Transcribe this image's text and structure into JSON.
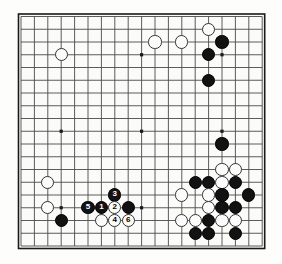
{
  "board": {
    "title": "Go board diagram",
    "size": 19,
    "origin_x": 21,
    "origin_y": 16.5,
    "spacing_x": 13.4,
    "spacing_y": 12.75,
    "stone_radius": 6.6,
    "line_color": "#4a4a4a",
    "border_color": "#1a1a1a",
    "background_color": "#fbfbf9",
    "black_color": "#121212",
    "white_color": "#fcfcfc",
    "star_points": [
      {
        "col": 3,
        "row": 3
      },
      {
        "col": 9,
        "row": 3
      },
      {
        "col": 15,
        "row": 3
      },
      {
        "col": 3,
        "row": 9
      },
      {
        "col": 9,
        "row": 9
      },
      {
        "col": 15,
        "row": 9
      },
      {
        "col": 3,
        "row": 15
      },
      {
        "col": 9,
        "row": 15
      },
      {
        "col": 15,
        "row": 15
      }
    ],
    "stones": [
      {
        "col": 14,
        "row": 1,
        "color": "white",
        "label": ""
      },
      {
        "col": 10,
        "row": 2,
        "color": "white",
        "label": ""
      },
      {
        "col": 12,
        "row": 2,
        "color": "white",
        "label": ""
      },
      {
        "col": 15,
        "row": 2,
        "color": "black",
        "label": ""
      },
      {
        "col": 14,
        "row": 3,
        "color": "black",
        "label": ""
      },
      {
        "col": 3,
        "row": 3,
        "color": "white",
        "label": ""
      },
      {
        "col": 14,
        "row": 5,
        "color": "black",
        "label": ""
      },
      {
        "col": 15,
        "row": 10,
        "color": "black",
        "label": ""
      },
      {
        "col": 15,
        "row": 12,
        "color": "white",
        "label": ""
      },
      {
        "col": 16,
        "row": 12,
        "color": "white",
        "label": ""
      },
      {
        "col": 13,
        "row": 13,
        "color": "black",
        "label": ""
      },
      {
        "col": 14,
        "row": 13,
        "color": "black",
        "label": ""
      },
      {
        "col": 15,
        "row": 13,
        "color": "white",
        "label": ""
      },
      {
        "col": 16,
        "row": 13,
        "color": "black",
        "label": ""
      },
      {
        "col": 2,
        "row": 13,
        "color": "white",
        "label": ""
      },
      {
        "col": 12,
        "row": 14,
        "color": "white",
        "label": ""
      },
      {
        "col": 14,
        "row": 14,
        "color": "white",
        "label": ""
      },
      {
        "col": 15,
        "row": 14,
        "color": "black",
        "label": ""
      },
      {
        "col": 17,
        "row": 14,
        "color": "black",
        "label": ""
      },
      {
        "col": 14,
        "row": 15,
        "color": "white",
        "label": ""
      },
      {
        "col": 15,
        "row": 15,
        "color": "black",
        "label": ""
      },
      {
        "col": 16,
        "row": 15,
        "color": "black",
        "label": ""
      },
      {
        "col": 2,
        "row": 15,
        "color": "white",
        "label": ""
      },
      {
        "col": 12,
        "row": 16,
        "color": "white",
        "label": ""
      },
      {
        "col": 13,
        "row": 16,
        "color": "white",
        "label": ""
      },
      {
        "col": 14,
        "row": 16,
        "color": "black",
        "label": ""
      },
      {
        "col": 15,
        "row": 16,
        "color": "white",
        "label": ""
      },
      {
        "col": 16,
        "row": 16,
        "color": "white",
        "label": ""
      },
      {
        "col": 13,
        "row": 17,
        "color": "black",
        "label": ""
      },
      {
        "col": 14,
        "row": 17,
        "color": "black",
        "label": ""
      },
      {
        "col": 16,
        "row": 17,
        "color": "black",
        "label": ""
      },
      {
        "col": 3,
        "row": 16,
        "color": "black",
        "label": ""
      },
      {
        "col": 7,
        "row": 14,
        "color": "black",
        "label": "3"
      },
      {
        "col": 5,
        "row": 15,
        "color": "black",
        "label": "5"
      },
      {
        "col": 6,
        "row": 15,
        "color": "black",
        "label": "1"
      },
      {
        "col": 7,
        "row": 15,
        "color": "white",
        "label": "2"
      },
      {
        "col": 8,
        "row": 15,
        "color": "black",
        "label": ""
      },
      {
        "col": 6,
        "row": 16,
        "color": "white",
        "label": ""
      },
      {
        "col": 7,
        "row": 16,
        "color": "white",
        "label": "4"
      },
      {
        "col": 8,
        "row": 16,
        "color": "white",
        "label": "6"
      }
    ],
    "move_sequence": [
      {
        "number": "1",
        "color": "black",
        "col": 6,
        "row": 15
      },
      {
        "number": "2",
        "color": "white",
        "col": 7,
        "row": 15
      },
      {
        "number": "3",
        "color": "black",
        "col": 7,
        "row": 14
      },
      {
        "number": "4",
        "color": "white",
        "col": 7,
        "row": 16
      },
      {
        "number": "5",
        "color": "black",
        "col": 5,
        "row": 15
      },
      {
        "number": "6",
        "color": "white",
        "col": 8,
        "row": 16
      }
    ]
  }
}
